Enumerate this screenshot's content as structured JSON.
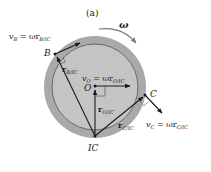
{
  "figure": {
    "caption": "(a)",
    "angular_velocity": {
      "symbol": "ω",
      "direction": "clockwise"
    },
    "colors": {
      "wheel_outer": "#a9a9a9",
      "wheel_inner": "#c4c4c4",
      "line": "#1a1a1a",
      "background": "#ffffff"
    },
    "points": {
      "B": {
        "label": "B"
      },
      "O": {
        "label": "O"
      },
      "C": {
        "label": "C"
      },
      "IC": {
        "label": "IC"
      }
    },
    "vectors": {
      "vB": {
        "lhs": "v",
        "lhs_sub": "B",
        "eq": " = ωr",
        "rhs_sub": "B/IC"
      },
      "vO": {
        "lhs": "v",
        "lhs_sub": "O",
        "eq": " = ωr",
        "rhs_sub": "O/IC"
      },
      "vC": {
        "lhs": "v",
        "lhs_sub": "C",
        "eq": " = ωr",
        "rhs_sub": "C/IC"
      },
      "rB": {
        "sym": "r",
        "sub": "B/IC"
      },
      "rO": {
        "sym": "r",
        "sub": "O/IC"
      },
      "rC": {
        "sym": "r",
        "sub": "C/IC"
      }
    }
  }
}
